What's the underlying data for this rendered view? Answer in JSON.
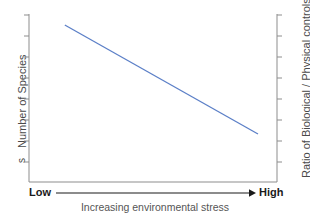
{
  "axes": {
    "left_title": "Number of Species",
    "left_title_orphan": "s",
    "right_title": "Ratio of Biological / Physical controls"
  },
  "xaxis": {
    "low_label": "Low",
    "high_label": "High",
    "caption": "Increasing environmental stress"
  },
  "colors": {
    "line": "#5b7fc7",
    "axis": "#8d8d8d",
    "arrow": "#1a1a1a",
    "label_text": "#4a4a4a",
    "caption_text": "#555555",
    "background": "#ffffff"
  },
  "chart_data": {
    "type": "line",
    "title": "",
    "xlabel": "Increasing environmental stress",
    "ylabel": "Number of Species",
    "y2label": "Ratio of Biological / Physical controls",
    "grid": false,
    "legend": "none",
    "xlim": [
      0,
      1
    ],
    "ylim": [
      0,
      1
    ],
    "xtick_labels": [
      "Low",
      "High"
    ],
    "ytick_count": 8,
    "y2tick_count": 8,
    "annotation": "Single straight declining trend line: species number falls as environmental stress increases, while the ratio of biological to physical controls decreases.",
    "series": [
      {
        "name": "Number of Species",
        "color": "#5b7fc7",
        "x": [
          0.08,
          1.0
        ],
        "y": [
          1.0,
          0.0
        ],
        "points": [
          {
            "x": 0.08,
            "y": 1.0
          },
          {
            "x": 0.31,
            "y": 0.75
          },
          {
            "x": 0.54,
            "y": 0.5
          },
          {
            "x": 0.77,
            "y": 0.25
          },
          {
            "x": 1.0,
            "y": 0.0
          }
        ]
      }
    ]
  }
}
